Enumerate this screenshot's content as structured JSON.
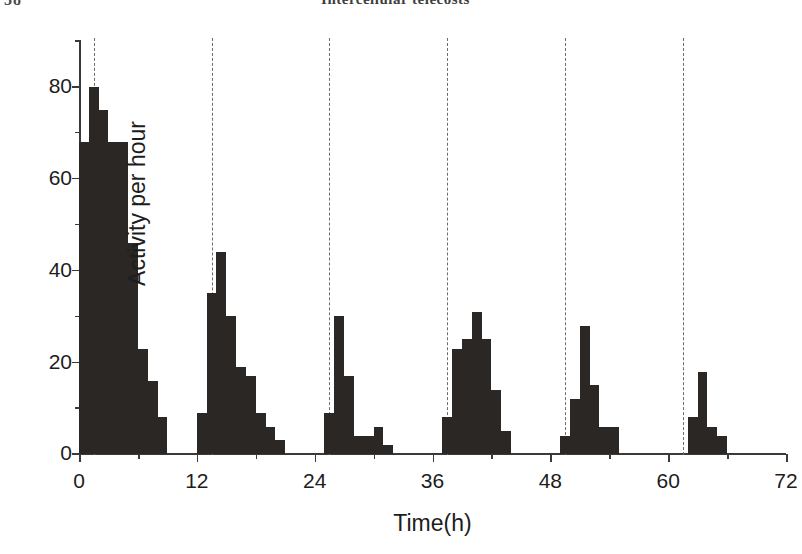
{
  "page": {
    "folio": "58",
    "running_head": "Intercellular telecosts"
  },
  "chart_data": {
    "type": "bar",
    "title": "",
    "subtitle": "",
    "xlabel": "Time(h)",
    "ylabel": "Activity per hour",
    "xlim": [
      0,
      72
    ],
    "ylim": [
      0,
      90
    ],
    "x_ticks": [
      0,
      12,
      24,
      36,
      48,
      60,
      72
    ],
    "x_tick_labels": [
      "0",
      "12",
      "24",
      "36",
      "48",
      "60",
      "72"
    ],
    "x_minor_ticks": [
      6,
      18,
      30,
      42,
      54,
      66
    ],
    "y_ticks": [
      0,
      20,
      40,
      60,
      80
    ],
    "y_tick_labels": [
      "0",
      "20",
      "40",
      "60",
      "80"
    ],
    "y_minor_ticks": [
      10,
      30,
      50,
      70,
      90
    ],
    "grid": false,
    "legend": null,
    "bar_width_hours": 1,
    "reference_lines": {
      "style": "dashed",
      "color": "#6d6d6d",
      "x_values": [
        1.5,
        13.5,
        25.5,
        37.5,
        49.5,
        61.5
      ]
    },
    "bar_color": "#2a2725",
    "x": [
      0,
      1,
      2,
      3,
      4,
      5,
      6,
      7,
      8,
      12,
      13,
      14,
      15,
      16,
      17,
      18,
      19,
      20,
      25,
      26,
      27,
      28,
      29,
      30,
      31,
      37,
      38,
      39,
      40,
      41,
      42,
      43,
      49,
      50,
      51,
      52,
      53,
      54,
      62,
      63,
      64,
      65
    ],
    "values": [
      68,
      80,
      75,
      68,
      68,
      46,
      23,
      16,
      8,
      9,
      35,
      44,
      30,
      19,
      17,
      9,
      6,
      3,
      9,
      30,
      17,
      4,
      4,
      6,
      2,
      8,
      23,
      25,
      31,
      25,
      14,
      5,
      4,
      12,
      28,
      15,
      6,
      6,
      8,
      18,
      6,
      4
    ],
    "bouts": [
      {
        "index": 1,
        "onset_hour": 0,
        "peak_value": 80,
        "values": [
          68,
          80,
          75,
          68,
          68,
          46,
          23,
          16,
          8
        ]
      },
      {
        "index": 2,
        "onset_hour": 12,
        "peak_value": 44,
        "values": [
          9,
          35,
          44,
          30,
          19,
          17,
          9,
          6,
          3
        ]
      },
      {
        "index": 3,
        "onset_hour": 25,
        "peak_value": 30,
        "values": [
          9,
          30,
          17,
          4,
          4,
          6,
          2
        ]
      },
      {
        "index": 4,
        "onset_hour": 37,
        "peak_value": 31,
        "values": [
          8,
          23,
          25,
          31,
          25,
          14,
          5
        ]
      },
      {
        "index": 5,
        "onset_hour": 49,
        "peak_value": 28,
        "values": [
          4,
          12,
          28,
          15,
          6,
          6
        ]
      },
      {
        "index": 6,
        "onset_hour": 62,
        "peak_value": 18,
        "values": [
          8,
          18,
          6,
          4
        ]
      }
    ]
  }
}
